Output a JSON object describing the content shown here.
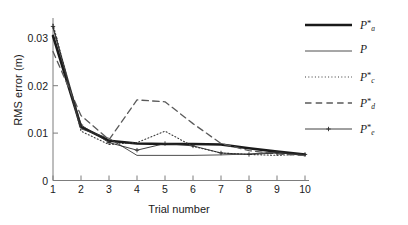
{
  "chart_data": {
    "type": "line",
    "title": "",
    "xlabel": "Trial number",
    "ylabel": "RMS error (m)",
    "x": [
      1,
      2,
      3,
      4,
      5,
      6,
      7,
      8,
      9,
      10
    ],
    "xlim": [
      1,
      10
    ],
    "ylim": [
      0,
      0.0335
    ],
    "xticks": [
      "1",
      "2",
      "3",
      "4",
      "5",
      "6",
      "7",
      "8",
      "9",
      "10"
    ],
    "yticks": [
      "0",
      "0.01",
      "0.02",
      "0.03"
    ],
    "ytick_values": [
      0,
      0.01,
      0.02,
      0.03
    ],
    "grid": false,
    "legend_position": "upper-right",
    "series": [
      {
        "name": "P*a",
        "label_base": "P",
        "label_sub": "a",
        "label_sup": "*",
        "style": "thick-solid",
        "color": "#1a1a1a",
        "width": 2.6,
        "marker": "none",
        "values": [
          0.0305,
          0.0113,
          0.0084,
          0.0078,
          0.0077,
          0.0077,
          0.0076,
          0.0068,
          0.0061,
          0.0055
        ]
      },
      {
        "name": "P",
        "label_base": "P",
        "label_sub": "",
        "label_sup": "",
        "style": "thin-solid",
        "color": "#3a3a3a",
        "width": 0.9,
        "marker": "none",
        "values": [
          0.0322,
          0.0109,
          0.0089,
          0.0053,
          0.0053,
          0.0053,
          0.0054,
          0.0056,
          0.006,
          0.0052
        ]
      },
      {
        "name": "P*c",
        "label_base": "P",
        "label_sub": "c",
        "label_sup": "*",
        "style": "dotted",
        "color": "#3a3a3a",
        "width": 1.1,
        "marker": "none",
        "values": [
          0.033,
          0.0104,
          0.0076,
          0.008,
          0.0104,
          0.0072,
          0.0058,
          0.0055,
          0.0053,
          0.0056
        ]
      },
      {
        "name": "P*d",
        "label_base": "P",
        "label_sub": "d",
        "label_sup": "*",
        "style": "dashed",
        "color": "#5a5a5a",
        "width": 1.3,
        "marker": "none",
        "values": [
          0.0272,
          0.0137,
          0.0086,
          0.017,
          0.0166,
          0.012,
          0.0078,
          0.0063,
          0.0056,
          0.0053
        ]
      },
      {
        "name": "P*e",
        "label_base": "P",
        "label_sub": "e",
        "label_sup": "*",
        "style": "thin-solid-marker",
        "color": "#2a2a2a",
        "width": 0.9,
        "marker": "plus",
        "values": [
          0.0325,
          0.0117,
          0.008,
          0.0064,
          0.0078,
          0.0073,
          0.0058,
          0.0055,
          0.0058,
          0.0055
        ]
      }
    ]
  },
  "axes": {
    "x_label": "Trial number",
    "y_label": "RMS error (m)"
  }
}
